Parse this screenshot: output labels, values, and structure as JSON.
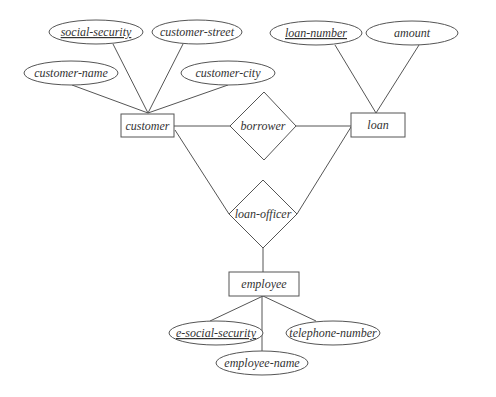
{
  "diagram": {
    "type": "er-diagram",
    "colors": {
      "stroke": "#555555",
      "text": "#333333",
      "background": "#ffffff"
    },
    "entities": [
      {
        "id": "customer",
        "label": "customer"
      },
      {
        "id": "loan",
        "label": "loan"
      },
      {
        "id": "employee",
        "label": "employee"
      }
    ],
    "relationships": [
      {
        "id": "borrower",
        "label": "borrower",
        "connects": [
          "customer",
          "loan"
        ]
      },
      {
        "id": "loan-officer",
        "label": "loan-officer",
        "connects": [
          "customer",
          "loan",
          "employee"
        ]
      }
    ],
    "attributes": {
      "social_security": {
        "label": "social-security",
        "entity": "customer",
        "key": true
      },
      "customer_street": {
        "label": "customer-street",
        "entity": "customer",
        "key": false
      },
      "customer_name": {
        "label": "customer-name",
        "entity": "customer",
        "key": false
      },
      "customer_city": {
        "label": "customer-city",
        "entity": "customer",
        "key": false
      },
      "loan_number": {
        "label": "loan-number",
        "entity": "loan",
        "key": true
      },
      "amount": {
        "label": "amount",
        "entity": "loan",
        "key": false
      },
      "e_social_security": {
        "label": "e-social-security",
        "entity": "employee",
        "key": true
      },
      "telephone_number": {
        "label": "telephone-number",
        "entity": "employee",
        "key": false
      },
      "employee_name": {
        "label": "employee-name",
        "entity": "employee",
        "key": false
      }
    },
    "labels": {
      "customer": "customer",
      "loan": "loan",
      "employee": "employee",
      "borrower": "borrower",
      "loan_officer": "loan-officer"
    }
  }
}
